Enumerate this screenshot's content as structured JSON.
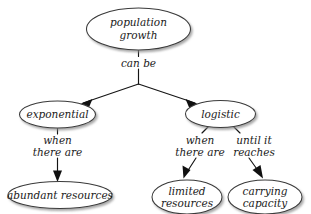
{
  "diagram": {
    "type": "concept-map",
    "background_color": "#ffffff",
    "node_fill": "#ffffff",
    "node_stroke": "#3a3a3a",
    "connector_color": "#101010",
    "nodes": [
      {
        "id": "population-growth",
        "label_line1": "population",
        "label_line2": "growth"
      },
      {
        "id": "exponential",
        "label_line1": "exponential",
        "label_line2": ""
      },
      {
        "id": "logistic",
        "label_line1": "logistic",
        "label_line2": ""
      },
      {
        "id": "abundant-resources",
        "label_line1": "abundant resources",
        "label_line2": ""
      },
      {
        "id": "limited-resources",
        "label_line1": "limited",
        "label_line2": "resources"
      },
      {
        "id": "carrying-capacity",
        "label_line1": "carrying",
        "label_line2": "capacity"
      }
    ],
    "links": [
      {
        "id": "can-be",
        "label_line1": "can be",
        "label_line2": ""
      },
      {
        "id": "exponential-when",
        "label_line1": "when",
        "label_line2": "there are"
      },
      {
        "id": "logistic-when",
        "label_line1": "when",
        "label_line2": "there are"
      },
      {
        "id": "logistic-until",
        "label_line1": "until it",
        "label_line2": "reaches"
      }
    ]
  }
}
